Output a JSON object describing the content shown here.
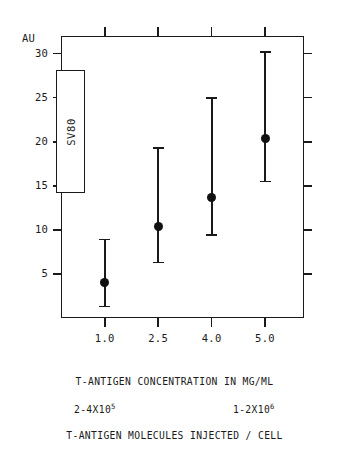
{
  "figure": {
    "unit_label": "AU",
    "y_tick_labels": [
      "30",
      "25",
      "20",
      "15",
      "10",
      "5"
    ],
    "x_tick_labels": [
      "1.0",
      "2.5",
      "4.0",
      "5.0"
    ],
    "x_axis_title": "T-ANTIGEN CONCENTRATION IN MG/ML",
    "bottom_caption": "T-ANTIGEN MOLECULES INJECTED / CELL",
    "note_left": "2-4X10",
    "note_left_exp": "5",
    "note_right": "1-2X10",
    "note_right_exp": "6",
    "legend_label": "SV80",
    "ink_color": "#1a1a1a",
    "marker_color": "#111111",
    "background_color": "#ffffff"
  },
  "chart_data": {
    "type": "scatter",
    "title": "",
    "subtitle": "",
    "xlabel": "T-ANTIGEN CONCENTRATION IN MG/ML",
    "ylabel": "AU",
    "categories": [
      "1.0",
      "2.5",
      "4.0",
      "5.0"
    ],
    "x": [
      1.0,
      2.5,
      4.0,
      5.0
    ],
    "values": [
      4.0,
      10.4,
      13.7,
      20.4
    ],
    "error_low": [
      1.3,
      6.3,
      9.4,
      15.5
    ],
    "error_high": [
      8.9,
      19.3,
      25.0,
      30.2
    ],
    "ylim": [
      0,
      32
    ],
    "y_ticks": [
      30,
      25,
      20,
      15,
      10,
      5
    ],
    "grid": false,
    "legend": [
      "SV80"
    ],
    "legend_position": "inside-left",
    "annotations": [
      {
        "text": "2-4X10^5",
        "position": "below-axis-left"
      },
      {
        "text": "1-2X10^6",
        "position": "below-axis-right"
      },
      {
        "text": "T-ANTIGEN MOLECULES INJECTED / CELL",
        "position": "bottom-caption"
      }
    ],
    "series": [
      {
        "name": "SV80",
        "points": [
          {
            "x": "1.0",
            "y": 4.0,
            "low": 1.3,
            "high": 8.9
          },
          {
            "x": "2.5",
            "y": 10.4,
            "low": 6.3,
            "high": 19.3
          },
          {
            "x": "4.0",
            "y": 13.7,
            "low": 9.4,
            "high": 25.0
          },
          {
            "x": "5.0",
            "y": 20.4,
            "low": 15.5,
            "high": 30.2
          }
        ]
      }
    ]
  }
}
